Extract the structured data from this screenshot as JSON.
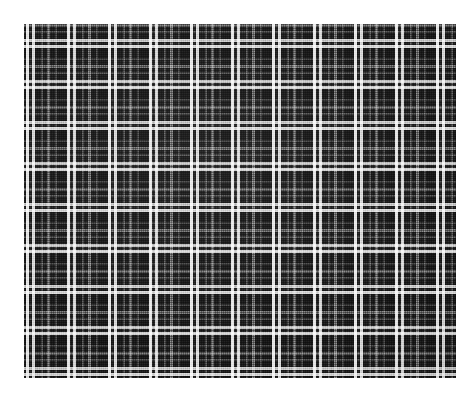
{
  "image": {
    "subject": "black-and-white-plaid-fabric-swatch",
    "width": 476,
    "height": 399,
    "background_color": "#ffffff",
    "alt_text": "Black and white tartan plaid woven fabric swatch"
  },
  "swatch": {
    "x": 24,
    "y": 24,
    "width": 432,
    "height": 354,
    "base_color": "#0e0e0e",
    "cloth_dark": "#121212",
    "cloth_shadow": "#060606",
    "label": "plaid-fabric-swatch"
  },
  "pattern": {
    "type": "tartan-check",
    "repeat_px": 43,
    "repeats_horizontal": 10,
    "repeats_vertical": 8,
    "colors": {
      "ground": "#0e0e0e",
      "ground_light": "#1c1c1c",
      "white": "#f2f2f2",
      "white_soft": "#cfcfcf",
      "gray_mid": "#7c7c7c",
      "gray_dim": "#4a4a4a",
      "gray_faint": "#303030"
    },
    "stripes": [
      {
        "name": "white-line-a",
        "offset": 2,
        "width": 3,
        "color": "#f2f2f2",
        "alpha": 0.95
      },
      {
        "name": "dark-gap",
        "offset": 5,
        "width": 3,
        "color": "#141414",
        "alpha": 1.0
      },
      {
        "name": "white-line-b",
        "offset": 8,
        "width": 3,
        "color": "#e8e8e8",
        "alpha": 0.92
      },
      {
        "name": "field-a",
        "offset": 11,
        "width": 6,
        "color": "#101010",
        "alpha": 1.0
      },
      {
        "name": "gray-hairline",
        "offset": 17,
        "width": 2,
        "color": "#555555",
        "alpha": 0.8
      },
      {
        "name": "field-b",
        "offset": 19,
        "width": 4,
        "color": "#0f0f0f",
        "alpha": 1.0
      },
      {
        "name": "gray-mid-line",
        "offset": 23,
        "width": 3,
        "color": "#8a8a8a",
        "alpha": 0.75
      },
      {
        "name": "field-c",
        "offset": 26,
        "width": 5,
        "color": "#101010",
        "alpha": 1.0
      },
      {
        "name": "gray-hairline-2",
        "offset": 31,
        "width": 2,
        "color": "#4e4e4e",
        "alpha": 0.7
      },
      {
        "name": "field-d",
        "offset": 33,
        "width": 10,
        "color": "#0d0d0d",
        "alpha": 1.0
      }
    ]
  },
  "weave": {
    "thread_pitch_px": 2,
    "warp_highlight": "rgba(255,255,255,0.085)",
    "weft_highlight": "rgba(255,255,255,0.075)",
    "noise_opacity": 0.4
  }
}
